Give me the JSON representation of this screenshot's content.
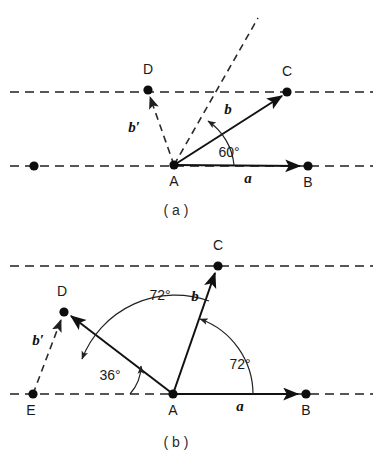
{
  "figure": {
    "background_color": "#ffffff",
    "ink_color": "#111111",
    "width": 383,
    "height": 463
  },
  "panel_a": {
    "caption": "( a )",
    "points": [
      {
        "name": "A",
        "label": "A",
        "x": 174,
        "y": 165,
        "label_x": 174,
        "label_y": 186
      },
      {
        "name": "B",
        "label": "B",
        "x": 308,
        "y": 166,
        "label_x": 308,
        "label_y": 187
      },
      {
        "name": "C",
        "label": "C",
        "x": 287,
        "y": 92,
        "label_x": 287,
        "label_y": 76
      },
      {
        "name": "D",
        "label": "D",
        "x": 148,
        "y": 90,
        "label_x": 148,
        "label_y": 74
      },
      {
        "name": "origin-left",
        "label": "",
        "x": 34,
        "y": 166,
        "label_x": 34,
        "label_y": 166
      }
    ],
    "vectors": [
      {
        "name": "a",
        "label": "a",
        "from": "A",
        "to": "B",
        "style": "solid",
        "label_x": 248,
        "label_y": 183
      },
      {
        "name": "b",
        "label": "b",
        "from": "A",
        "to": "C",
        "style": "solid",
        "label_x": 228,
        "label_y": 114
      },
      {
        "name": "b-prime",
        "label": "b′",
        "from": "A",
        "to": "D",
        "style": "dashed",
        "label_x": 134,
        "label_y": 132
      }
    ],
    "angles": [
      {
        "name": "angle-BAC",
        "label": "60°",
        "value": 60,
        "unit": "degrees",
        "label_x": 229,
        "label_y": 157
      }
    ],
    "guide_lines": [
      {
        "name": "upper-horizontal-dashed",
        "x1": 10,
        "y1": 92,
        "x2": 373,
        "y2": 92
      },
      {
        "name": "lower-horizontal-dashed",
        "x1": 10,
        "y1": 166,
        "x2": 373,
        "y2": 166
      },
      {
        "name": "bisector-dashed",
        "x1": 174,
        "y1": 165,
        "x2": 258,
        "y2": 18
      }
    ]
  },
  "panel_b": {
    "caption": "( b )",
    "points": [
      {
        "name": "A",
        "label": "A",
        "x": 173,
        "y": 394,
        "label_x": 173,
        "label_y": 415
      },
      {
        "name": "B",
        "label": "B",
        "x": 306,
        "y": 394,
        "label_x": 306,
        "label_y": 415
      },
      {
        "name": "C",
        "label": "C",
        "x": 218,
        "y": 266,
        "label_x": 218,
        "label_y": 250
      },
      {
        "name": "D",
        "label": "D",
        "x": 64,
        "y": 312,
        "label_x": 62,
        "label_y": 296
      },
      {
        "name": "E",
        "label": "E",
        "x": 33,
        "y": 394,
        "label_x": 31,
        "label_y": 415
      }
    ],
    "vectors": [
      {
        "name": "a",
        "label": "a",
        "from": "A",
        "to": "B",
        "style": "solid",
        "label_x": 240,
        "label_y": 411
      },
      {
        "name": "b",
        "label": "b",
        "from": "A",
        "to": "C",
        "style": "solid",
        "label_x": 195,
        "label_y": 301
      },
      {
        "name": "b-prime-AD",
        "label": "",
        "from": "A",
        "to": "D",
        "style": "solid",
        "label_x": 0,
        "label_y": 0
      },
      {
        "name": "b-prime-ED",
        "label": "b′",
        "from": "E",
        "to": "D",
        "style": "dashed",
        "label_x": 38,
        "label_y": 345
      }
    ],
    "angles": [
      {
        "name": "angle-BAC",
        "label": "72°",
        "value": 72,
        "unit": "degrees",
        "label_x": 240,
        "label_y": 369
      },
      {
        "name": "angle-CAD",
        "label": "72°",
        "value": 72,
        "unit": "degrees",
        "label_x": 160,
        "label_y": 300
      },
      {
        "name": "angle-DAB-supp",
        "label": "36°",
        "value": 36,
        "unit": "degrees",
        "label_x": 110,
        "label_y": 380
      }
    ],
    "guide_lines": [
      {
        "name": "upper-horizontal-dashed",
        "x1": 10,
        "y1": 266,
        "x2": 373,
        "y2": 266
      },
      {
        "name": "lower-horizontal-dashed",
        "x1": 10,
        "y1": 394,
        "x2": 373,
        "y2": 394
      }
    ]
  }
}
